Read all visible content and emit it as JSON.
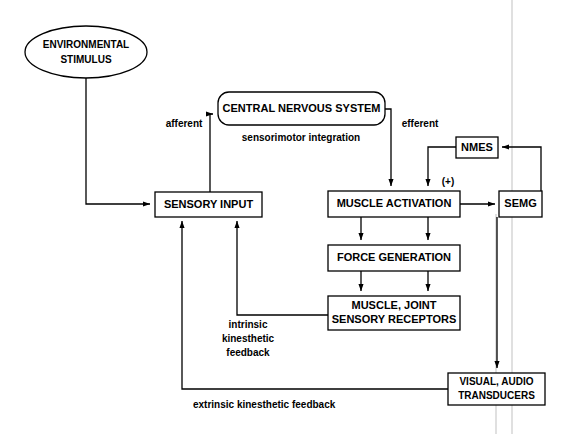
{
  "diagram": {
    "background_color": "#ffffff",
    "line_color": "#000000",
    "faint_line_color": "#cccccc",
    "nodes": {
      "environmental_stimulus": {
        "shape": "ellipse",
        "line1": "ENVIRONMENTAL",
        "line2": "STIMULUS"
      },
      "central_nervous_system": {
        "shape": "rounded-rect",
        "label": "CENTRAL NERVOUS SYSTEM"
      },
      "sensorimotor_integration": {
        "shape": "caption",
        "label": "sensorimotor integration"
      },
      "sensory_input": {
        "shape": "rect",
        "label": "SENSORY INPUT"
      },
      "muscle_activation": {
        "shape": "rect",
        "label": "MUSCLE ACTIVATION"
      },
      "force_generation": {
        "shape": "rect",
        "label": "FORCE GENERATION"
      },
      "muscle_joint_sensory_receptors": {
        "shape": "rect",
        "line1": "MUSCLE, JOINT",
        "line2": "SENSORY RECEPTORS"
      },
      "nmes": {
        "shape": "rect",
        "label": "NMES"
      },
      "semg": {
        "shape": "rect",
        "label": "SEMG"
      },
      "visual_audio_transducers": {
        "shape": "rect",
        "line1": "VISUAL, AUDIO",
        "line2": "TRANSDUCERS"
      }
    },
    "edge_labels": {
      "afferent": "afferent",
      "efferent": "efferent",
      "plus_sign": "(+)",
      "intrinsic_line1": "intrinsic",
      "intrinsic_line2": "kinesthetic",
      "intrinsic_line3": "feedback",
      "extrinsic": "extrinsic kinesthetic feedback"
    }
  }
}
